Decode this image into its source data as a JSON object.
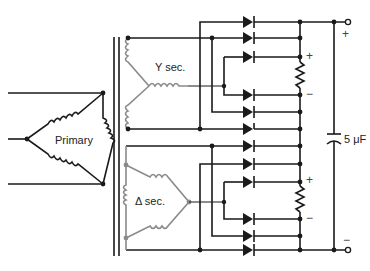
{
  "diagram": {
    "labels": {
      "primary": "Primary",
      "y_secondary": "Y sec.",
      "delta_secondary": "Δ sec.",
      "capacitor": "5 μF",
      "upper_resistor_plus": "+",
      "upper_resistor_minus": "−",
      "lower_resistor_plus": "+",
      "lower_resistor_minus": "−",
      "output_plus": "+",
      "output_minus": "−"
    },
    "colors": {
      "wire": "#1a1a1a",
      "secondary_winding": "#8a8a8a",
      "background": "#ffffff"
    },
    "components": {
      "transformer": "three-phase transformer: delta primary, Y and delta secondaries",
      "rectifiers": "two three-phase full-wave bridge rectifiers (12 diodes) in series",
      "resistors": 2,
      "capacitor": "5 μF filter capacitor"
    }
  }
}
